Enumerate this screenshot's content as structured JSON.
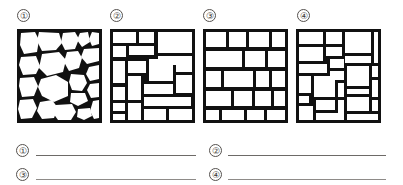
{
  "worksheet": {
    "title": "",
    "background_color": "#ffffff",
    "ink_color": "#111111",
    "line_color": "#6d6a67"
  },
  "markers": {
    "one": "①",
    "two": "②",
    "three": "③",
    "four": "④"
  },
  "figures": [
    {
      "marker": "①",
      "name": "figure-1",
      "pattern": "random-rubble-masonry",
      "description": "Irregular uncut rounded stones, no courses, thick mortar joints"
    },
    {
      "marker": "②",
      "name": "figure-2",
      "pattern": "squared-rubble-uncoursed",
      "description": "Roughly squared stones of varying size, broken courses"
    },
    {
      "marker": "③",
      "name": "figure-3",
      "pattern": "coursed-ashlar",
      "description": "Regular rectangular blocks laid in continuous horizontal courses"
    },
    {
      "marker": "④",
      "name": "figure-4",
      "pattern": "random-ashlar",
      "description": "Rectangular cut stones of mixed sizes, discontinuous joints"
    }
  ],
  "answers": [
    {
      "marker": "①",
      "value": "",
      "placeholder": ""
    },
    {
      "marker": "②",
      "value": "",
      "placeholder": ""
    },
    {
      "marker": "③",
      "value": "",
      "placeholder": ""
    },
    {
      "marker": "④",
      "value": "",
      "placeholder": ""
    }
  ]
}
